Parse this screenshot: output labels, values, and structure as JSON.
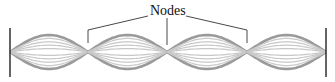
{
  "diagram": {
    "label": "Nodes",
    "loops": 4,
    "node_x": [
      10,
      88,
      167,
      247,
      326
    ],
    "centerline_y": 52,
    "amplitude_px": 17,
    "colors": {
      "wave_outer": "#9a9a9a",
      "wave_inner": "#c8c8c8",
      "wall": "#111111",
      "pointer": "#333333",
      "text": "#111111"
    }
  }
}
